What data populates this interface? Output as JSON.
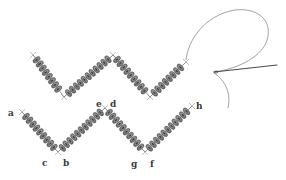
{
  "figure": {
    "colors": {
      "background": "#ffffff",
      "bead_dark": "#5a5a5a",
      "bead_mid": "#8a8a8a",
      "bead_light": "#b8b8b8",
      "thread": "#7a7a7a",
      "needle": "#4a4a4a",
      "label": "#3a3a3a"
    },
    "labels": [
      {
        "id": "a",
        "text": "a",
        "x": 8,
        "y": 109
      },
      {
        "id": "e",
        "text": "e",
        "x": 96,
        "y": 100
      },
      {
        "id": "d",
        "text": "d",
        "x": 110,
        "y": 100
      },
      {
        "id": "h",
        "text": "h",
        "x": 196,
        "y": 102
      },
      {
        "id": "c",
        "text": "c",
        "x": 42,
        "y": 159
      },
      {
        "id": "b",
        "text": "b",
        "x": 63,
        "y": 159
      },
      {
        "id": "g",
        "text": "g",
        "x": 131,
        "y": 160
      },
      {
        "id": "f",
        "text": "f",
        "x": 150,
        "y": 160
      }
    ],
    "strands": [
      {
        "name": "top-strand",
        "points": [
          [
            33,
            55
          ],
          [
            64,
            97
          ],
          [
            113,
            55
          ],
          [
            150,
            97
          ],
          [
            186,
            62
          ]
        ]
      },
      {
        "name": "bottom-strand",
        "points": [
          [
            22,
            112
          ],
          [
            58,
            152
          ],
          [
            105,
            108
          ],
          [
            145,
            152
          ],
          [
            192,
            106
          ]
        ]
      }
    ]
  }
}
